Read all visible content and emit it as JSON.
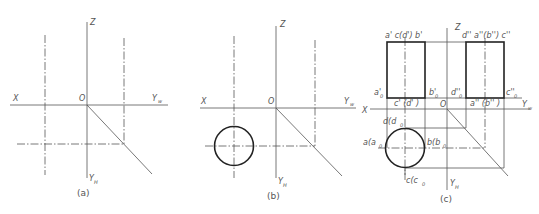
{
  "figure": {
    "panels": [
      {
        "id": "a",
        "caption": "(a)",
        "axis_labels": {
          "x": "X",
          "z": "Z",
          "origin": "O",
          "yw": "Y",
          "yw_sub": "w",
          "yh": "Y",
          "yh_sub": "H"
        }
      },
      {
        "id": "b",
        "caption": "(b)",
        "axis_labels": {
          "x": "X",
          "z": "Z",
          "origin": "O",
          "yw": "Y",
          "yw_sub": "w",
          "yh": "Y",
          "yh_sub": "H"
        }
      },
      {
        "id": "c",
        "caption": "(c)",
        "axis_labels": {
          "x": "X",
          "z": "Z",
          "origin": "O",
          "yw": "Y",
          "yw_sub": "w",
          "yh": "Y",
          "yh_sub": "H"
        },
        "front_view_labels": {
          "top": "a'  c(d')  b'",
          "bottom_left": "a'",
          "bottom_left_sub": "0",
          "bottom_right": "b'",
          "bottom_right_sub": "0",
          "bottom_mid": "c'  (d'  )",
          "bottom_mid_sub": "0"
        },
        "side_view_labels": {
          "top": "d'' a''(b'') c''",
          "bottom_left": "d''",
          "bottom_left_sub": "0",
          "bottom_right": "c''",
          "bottom_right_sub": "0",
          "bottom_mid": "a''  (b''  )",
          "bottom_mid_sub": "0"
        },
        "top_view_labels": {
          "top": "d(d",
          "top_sub": "0",
          "left": "a(a",
          "left_sub": "0",
          "right": "b(b",
          "right_sub": "0",
          "bottom": "c(c",
          "bottom_sub": "0"
        }
      }
    ]
  }
}
